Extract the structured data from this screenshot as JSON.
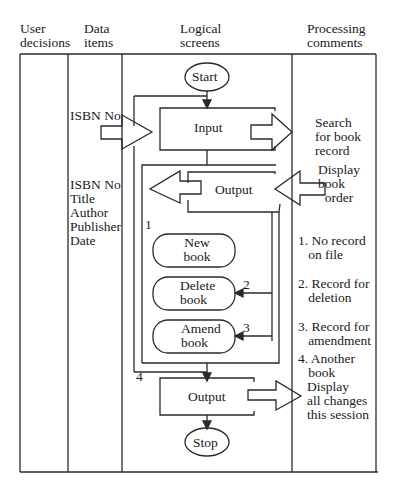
{
  "headers": {
    "user_decisions": [
      "User",
      "decisions"
    ],
    "data_items": [
      "Data",
      "items"
    ],
    "logical_screens": [
      "Logical",
      "screens"
    ],
    "processing_comments": [
      "Processing",
      "comments"
    ]
  },
  "data_items": {
    "input_item": "ISBN No",
    "output_items": [
      "ISBN No",
      "Title",
      "Author",
      "Publisher",
      "Date"
    ]
  },
  "screens": {
    "start": "Start",
    "input": "Input",
    "output1": "Output",
    "new_book": [
      "New",
      "book"
    ],
    "delete_book": [
      "Delete",
      "book"
    ],
    "amend_book": [
      "Amend",
      "book"
    ],
    "output2": "Output",
    "stop": "Stop"
  },
  "branch_labels": {
    "one": "1",
    "two": "2",
    "three": "3",
    "four": "4"
  },
  "comments": {
    "search": [
      "Search",
      "for book",
      "record"
    ],
    "display_order": [
      "Display",
      "book",
      "order"
    ],
    "c1": [
      "1. No record",
      "on file"
    ],
    "c2": [
      "2. Record for",
      "deletion"
    ],
    "c3": [
      "3. Record for",
      "amendment"
    ],
    "c4": [
      "4. Another",
      "book"
    ],
    "display_changes": [
      "Display",
      "all changes",
      "this session"
    ]
  },
  "colors": {
    "line": "#2a2a2a",
    "background": "#ffffff"
  }
}
